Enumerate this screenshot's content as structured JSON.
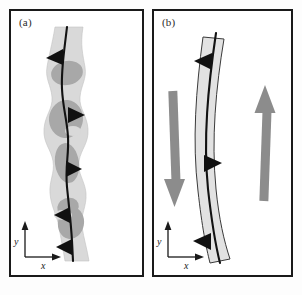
{
  "figure": {
    "background": "#fdfdfd",
    "frame_color": "#1a1a1a",
    "caption_sliver": " "
  },
  "colors": {
    "band_fill": "#d9d9d9",
    "band_fill_b": "#e2e2e2",
    "lens_fill": "#a8a8a8",
    "band_outline": "#4a4a4a",
    "center_line": "#121212",
    "marker": "#111111",
    "shear_arrow": "#8c8c8c",
    "axis": "#1a1a1a",
    "label_text": "#2b2b2b"
  },
  "panels": [
    {
      "id": "a",
      "label": "(a)",
      "description": "irregular anastomosing shear zone with dark lenses",
      "band_style": "irregular",
      "center_line_markers": 5,
      "lens_count": 5,
      "has_shear_couple_arrows": false,
      "axes": {
        "x_label": "x",
        "y_label": "y"
      }
    },
    {
      "id": "b",
      "label": "(b)",
      "description": "smooth curved shear zone with shear couple arrows",
      "band_style": "smooth-curved",
      "center_line_markers": 3,
      "lens_count": 0,
      "has_shear_couple_arrows": true,
      "shear_arrows": [
        {
          "name": "left-shear-arrow",
          "direction": "down"
        },
        {
          "name": "right-shear-arrow",
          "direction": "up"
        }
      ],
      "axes": {
        "x_label": "x",
        "y_label": "y"
      }
    }
  ]
}
